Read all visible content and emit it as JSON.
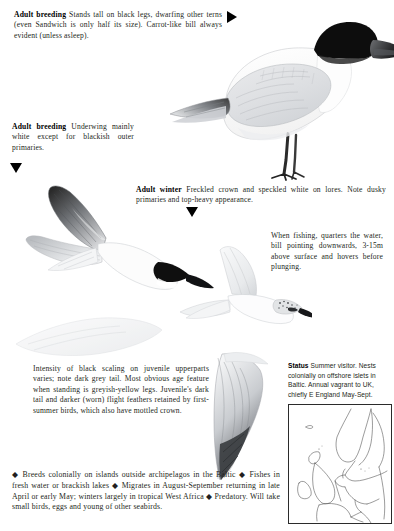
{
  "page": {
    "species": "Gull-billed Tern",
    "background_color": "#ffffff",
    "text_color": "#231f20"
  },
  "captions": {
    "adult_breeding_standing": {
      "lead": "Adult breeding",
      "body": " Stands tall on black legs, dwarfing other terns (even Sandwich is only half its size). Carrot-like bill always evident (unless asleep)."
    },
    "adult_breeding_underwing": {
      "lead": "Adult breeding",
      "body": " Underwing mainly white except for blackish outer primaries."
    },
    "adult_winter": {
      "lead": "Adult winter",
      "body": " Freckled crown and speckled white on lores. Note dusky primaries and top-heavy appearance."
    },
    "fishing": {
      "lead": "",
      "body": "When fishing, quarters the water, bill pointing downwards, 3-15m above surface and hovers before plunging."
    },
    "juvenile": {
      "lead": "",
      "body": "Intensity of black scaling on juvenile upperparts varies; note dark grey tail. Most obvious age feature when standing is greyish-yellow legs. Juvenile's dark tail and darker (worn) flight feathers retained by first-summer birds, which also have mottled crown."
    }
  },
  "status": {
    "lead": "Status",
    "body": " Summer visitor. Nests colonially on offshore islets in Baltic. Annual vagrant to UK, chiefly E England May-Sept."
  },
  "facts": {
    "text": "◆ Breeds colonially on islands outside archipelagos in the Baltic ◆ Fishes in fresh water or brackish lakes ◆ Migrates in August-September returning in late April or early May; winters largely in tropical West Africa ◆ Predatory. Will take small birds, eggs and young of other seabirds."
  },
  "pointers": [
    {
      "name": "pointer-standing",
      "direction": "right",
      "color": "#000000"
    },
    {
      "name": "pointer-underwing",
      "direction": "down",
      "color": "#000000"
    },
    {
      "name": "pointer-winter",
      "direction": "down",
      "color": "#000000"
    }
  ],
  "illustrations": [
    {
      "name": "standing-adult-breeding",
      "label": "Adult breeding standing tern"
    },
    {
      "name": "underwing-flight",
      "label": "Adult breeding underwing in flight"
    },
    {
      "name": "adult-winter-flight",
      "label": "Adult winter in flight"
    },
    {
      "name": "juvenile-flight",
      "label": "Juvenile in flight"
    },
    {
      "name": "upperwing-detail",
      "label": "Upperwing detail"
    }
  ],
  "map": {
    "name": "range-map",
    "region": "Northwest Europe",
    "border_color": "#2b2b2b",
    "land_color": "#ffffff"
  }
}
